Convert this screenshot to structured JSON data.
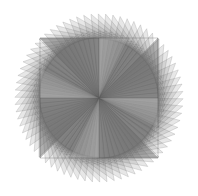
{
  "figure": {
    "center": [
      99,
      98
    ],
    "square_corners": [
      [
        40,
        38
      ],
      [
        158,
        38
      ],
      [
        158,
        158
      ],
      [
        40,
        158
      ]
    ],
    "rotations": 18,
    "rotation_step_deg": -5,
    "blade_fill": "#6b6b6b",
    "blade_opacity": 0.16,
    "edge_color": "#555555",
    "background": "#ffffff"
  }
}
